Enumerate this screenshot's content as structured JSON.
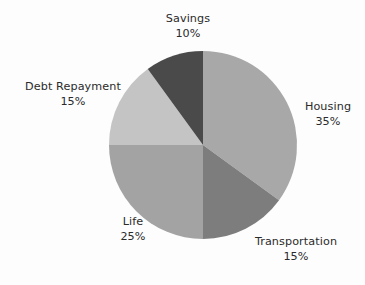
{
  "chart_data": {
    "type": "pie",
    "title": "",
    "subtitle": "",
    "xlabel": "",
    "ylabel": "",
    "legend_position": "none",
    "grid": false,
    "labels_outside": true,
    "start_angle_deg": 0,
    "direction": "clockwise",
    "categories": [
      "Housing",
      "Transportation",
      "Life",
      "Debt Repayment",
      "Savings"
    ],
    "values": [
      35,
      15,
      25,
      15,
      10
    ],
    "value_unit": "%",
    "total": 100,
    "slices": [
      {
        "name": "Housing",
        "value": 35,
        "label": "Housing",
        "percent_label": "35%",
        "color": "#a8a8a8",
        "start_deg": 0,
        "end_deg": 126
      },
      {
        "name": "Transportation",
        "value": 15,
        "label": "Transportation",
        "percent_label": "15%",
        "color": "#7d7d7d",
        "start_deg": 126,
        "end_deg": 180
      },
      {
        "name": "Life",
        "value": 25,
        "label": "Life",
        "percent_label": "25%",
        "color": "#a3a3a3",
        "start_deg": 180,
        "end_deg": 270
      },
      {
        "name": "Debt Repayment",
        "value": 15,
        "label": "Debt Repayment",
        "percent_label": "15%",
        "color": "#c4c4c4",
        "start_deg": 270,
        "end_deg": 324
      },
      {
        "name": "Savings",
        "value": 10,
        "label": "Savings",
        "percent_label": "10%",
        "color": "#4a4a4a",
        "start_deg": 324,
        "end_deg": 360
      }
    ]
  },
  "geometry": {
    "center_x": 203,
    "center_y": 145,
    "radius": 94
  },
  "colors": {
    "background": "#fdfdfd",
    "text": "#2b2b2b"
  }
}
